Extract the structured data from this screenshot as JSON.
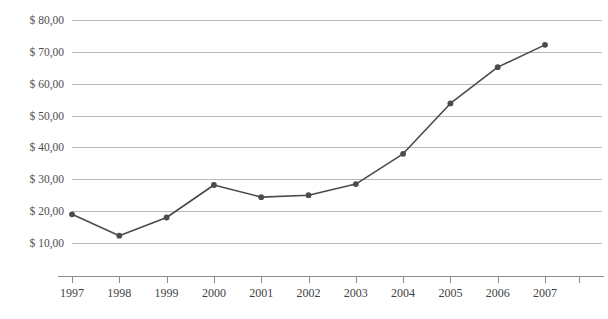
{
  "chart_data": {
    "type": "line",
    "title": "",
    "subtitle": "",
    "xlabel": "",
    "ylabel": "",
    "categories": [
      "1997",
      "1998",
      "1999",
      "2000",
      "2001",
      "2002",
      "2003",
      "2004",
      "2005",
      "2006",
      "2007"
    ],
    "values": [
      19.0,
      12.3,
      18.0,
      28.2,
      24.4,
      25.0,
      28.5,
      38.0,
      53.8,
      65.2,
      72.2
    ],
    "series": [
      {
        "name": "",
        "values": [
          19.0,
          12.3,
          18.0,
          28.2,
          24.4,
          25.0,
          28.5,
          38.0,
          53.8,
          65.2,
          72.2
        ]
      }
    ],
    "ylim": [
      10,
      80
    ],
    "xlim": [
      "1997",
      "2007"
    ],
    "y_tick_labels": [
      "$ 80,00",
      "$ 70,00",
      "$ 60,00",
      "$ 50,00",
      "$ 40,00",
      "$ 30,00",
      "$ 20,00",
      "$ 10,00"
    ],
    "y_tick_values": [
      80,
      70,
      60,
      50,
      40,
      30,
      20,
      10
    ],
    "x_tick_labels": [
      "1997",
      "1998",
      "1999",
      "2000",
      "2001",
      "2002",
      "2003",
      "2004",
      "2005",
      "2006",
      "2007"
    ],
    "grid": "horizontal",
    "legend": "none",
    "annotations": [],
    "colors": {
      "line": "#4a4a4f",
      "marker": "#4a4a4f",
      "gridline": "#b9b9b9",
      "axis": "#8d8d8d",
      "tick_label": "#3f3f44",
      "background": "#ffffff",
      "title": "#9a9aa2"
    },
    "marker_style": "circle",
    "currency_symbol": "$",
    "decimal_separator": ","
  },
  "axis": {
    "y_title": "",
    "x_title": ""
  }
}
